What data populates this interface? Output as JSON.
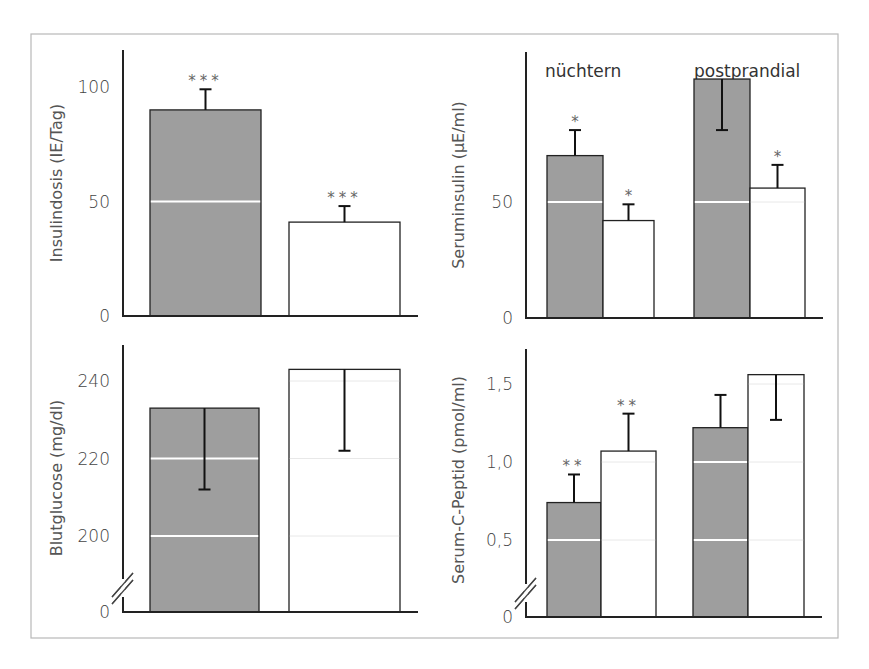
{
  "colors": {
    "frame": "#b8b8b8",
    "axis": "#222222",
    "bar_filled": "#9e9e9e",
    "bar_open": "#ffffff",
    "gridline_in_bar": "#ffffff"
  },
  "chart_data": [
    {
      "id": "insulindosis",
      "type": "bar",
      "title": "",
      "ylabel": "Insulindosis (IE/Tag)",
      "xlabel": "",
      "ylim": [
        0,
        115
      ],
      "yticks": [
        0,
        50,
        100
      ],
      "ytick_labels": [
        "0",
        "50",
        "100"
      ],
      "group_labels": [],
      "categories": [
        "filled",
        "open"
      ],
      "values": [
        90,
        41
      ],
      "errors": [
        {
          "dir": "up",
          "to": 99
        },
        {
          "dir": "up",
          "to": 48
        }
      ],
      "significance": [
        "***",
        "***"
      ],
      "axis_break": false
    },
    {
      "id": "seruminsulin",
      "type": "bar",
      "title": "",
      "ylabel": "Seruminsulin (µE/ml)",
      "xlabel": "",
      "ylim": [
        0,
        115
      ],
      "yticks": [
        0,
        50
      ],
      "ytick_labels": [
        "0",
        "50"
      ],
      "group_labels": [
        "nüchtern",
        "postprandial"
      ],
      "categories": [
        "nüchtern-filled",
        "nüchtern-open",
        "postprandial-filled",
        "postprandial-open"
      ],
      "values": [
        70,
        42,
        103,
        56
      ],
      "errors": [
        {
          "dir": "up",
          "to": 81
        },
        {
          "dir": "up",
          "to": 49
        },
        {
          "dir": "down",
          "to": 81
        },
        {
          "dir": "up",
          "to": 66
        }
      ],
      "significance": [
        "*",
        "*",
        "",
        "*"
      ],
      "axis_break": false
    },
    {
      "id": "blutglucose",
      "type": "bar",
      "title": "",
      "ylabel": "Blutglucose (mg/dl)",
      "xlabel": "",
      "ylim": [
        0,
        250
      ],
      "yticks": [
        0,
        200,
        220,
        240
      ],
      "ytick_labels": [
        "0",
        "200",
        "220",
        "240"
      ],
      "group_labels": [],
      "categories": [
        "filled",
        "open"
      ],
      "values": [
        233,
        243
      ],
      "errors": [
        {
          "dir": "down",
          "to": 212
        },
        {
          "dir": "down",
          "to": 222
        }
      ],
      "significance": [
        "",
        ""
      ],
      "axis_break": true
    },
    {
      "id": "c-peptid",
      "type": "bar",
      "title": "",
      "ylabel": "Serum-C-Peptid (pmol/ml)",
      "xlabel": "",
      "ylim": [
        0,
        1.7
      ],
      "yticks": [
        0,
        0.5,
        1.0,
        1.5
      ],
      "ytick_labels": [
        "0",
        "0,5",
        "1,0",
        "1,5"
      ],
      "group_labels": [],
      "categories": [
        "nüchtern-filled",
        "nüchtern-open",
        "postprandial-filled",
        "postprandial-open"
      ],
      "values": [
        0.74,
        1.07,
        1.22,
        1.56
      ],
      "errors": [
        {
          "dir": "up",
          "to": 0.92
        },
        {
          "dir": "up",
          "to": 1.31
        },
        {
          "dir": "up",
          "to": 1.43
        },
        {
          "dir": "down",
          "to": 1.27
        }
      ],
      "significance": [
        "**",
        "**",
        "",
        ""
      ],
      "axis_break": true
    }
  ]
}
